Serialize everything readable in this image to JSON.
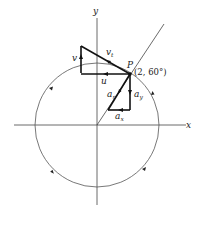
{
  "diagram": {
    "type": "polar-coordinates-velocity-acceleration",
    "axes": {
      "x_label": "x",
      "y_label": "y"
    },
    "point": {
      "label": "P",
      "coords": "(2, 60°)"
    },
    "vectors": {
      "v_t": {
        "base": "v",
        "sub": "t"
      },
      "v": {
        "base": "v"
      },
      "u": {
        "base": "u"
      },
      "a_r": {
        "base": "a",
        "sub": "r"
      },
      "a_x": {
        "base": "a",
        "sub": "x"
      },
      "a_y": {
        "base": "a",
        "sub": "y"
      }
    },
    "colors": {
      "stroke": "#222222",
      "background": "#ffffff"
    }
  }
}
